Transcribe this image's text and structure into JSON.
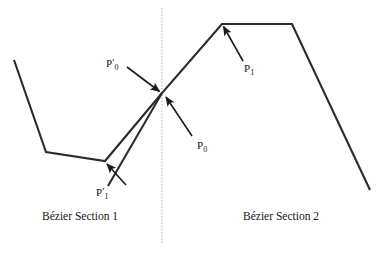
{
  "figure": {
    "background_color": "#ffffff",
    "stroke_color": "#2b2b2b",
    "divider_color": "#b9b9b9",
    "width": 387,
    "height": 253
  },
  "labels": {
    "p0_prime": {
      "base": "P",
      "prime": "′",
      "sub": "0"
    },
    "p1_prime": {
      "base": "P",
      "prime": "′",
      "sub": "1"
    },
    "p0": {
      "base": "P",
      "prime": "",
      "sub": "0"
    },
    "p1": {
      "base": "P",
      "prime": "",
      "sub": "1"
    },
    "section_1": "Bézier Section 1",
    "section_2": "Bézier Section 2"
  },
  "geometry": {
    "divider_x": 162,
    "divider_y_top": 8,
    "divider_y_bottom": 245,
    "polyline_left": "14,60 46,152 105,161 162,93",
    "polyline_right": "108,186 162,93 222,24 292,24 370,190",
    "arrows": [
      {
        "name": "arrow-p0-prime",
        "from": "127,67",
        "to": "160,92"
      },
      {
        "name": "arrow-p1-prime",
        "from": "126,185",
        "to": "106,163"
      },
      {
        "name": "arrow-p0",
        "from": "192,136",
        "to": "166,97"
      },
      {
        "name": "arrow-p1",
        "from": "243,61",
        "to": "223,26"
      }
    ]
  }
}
